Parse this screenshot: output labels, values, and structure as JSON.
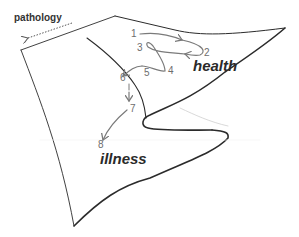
{
  "diagram": {
    "title_arrow_label": "pathology",
    "region_labels": {
      "health": "health",
      "illness": "illness"
    },
    "trajectory_points": [
      "1",
      "2",
      "3",
      "4",
      "5",
      "6",
      "7",
      "8"
    ],
    "colors": {
      "surface_edge": "#2b2b2b",
      "trajectory": "#7a7a7a",
      "labels": "#6d6d6d",
      "fold_hidden": "#cfcfcf"
    }
  }
}
